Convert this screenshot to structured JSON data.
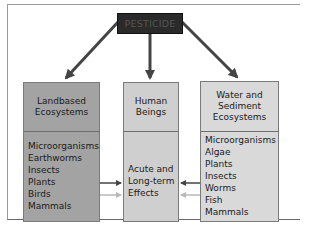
{
  "diagram": {
    "source": {
      "label": "PESTICIDE",
      "fill": "#2a2a2a"
    },
    "targets": [
      {
        "id": "landbased",
        "title": [
          "Landbased",
          "Ecosystems"
        ],
        "items": [
          "Microorganisms",
          "Earthworms",
          "Insects",
          "Plants",
          "Birds",
          "Mammals"
        ],
        "fill": "#a3a3a3"
      },
      {
        "id": "human",
        "title": [
          "Human",
          "Beings"
        ],
        "items": [
          "Acute and",
          "Long-term",
          "Effects"
        ],
        "fill": "#cfcfcf"
      },
      {
        "id": "water",
        "title": [
          "Water and",
          "Sediment",
          "Ecosystems"
        ],
        "items": [
          "Microorganisms",
          "Algae",
          "Plants",
          "Insects",
          "Worms",
          "Fish",
          "Mammals"
        ],
        "fill": "#d9d9d9"
      }
    ],
    "edges": [
      {
        "from": "PESTICIDE",
        "to": "Landbased Ecosystems"
      },
      {
        "from": "PESTICIDE",
        "to": "Human Beings"
      },
      {
        "from": "PESTICIDE",
        "to": "Water and Sediment Ecosystems"
      },
      {
        "from": "Landbased Ecosystems",
        "to": "Human Beings",
        "style": "dark"
      },
      {
        "from": "Landbased Ecosystems",
        "to": "Human Beings",
        "style": "light"
      },
      {
        "from": "Water and Sediment Ecosystems",
        "to": "Human Beings",
        "style": "dark"
      },
      {
        "from": "Water and Sediment Ecosystems",
        "to": "Human Beings",
        "style": "light"
      }
    ],
    "colors": {
      "arrow_dark": "#444444",
      "arrow_light": "#b8b8b8"
    }
  }
}
